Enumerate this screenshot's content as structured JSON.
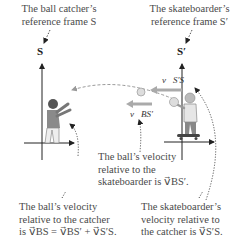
{
  "labels": {
    "catcher_frame": [
      "The ball catcher’s",
      "reference frame S"
    ],
    "skater_frame": [
      "The skateboarder’s",
      "reference frame S′"
    ],
    "axis_s": "S",
    "axis_s_prime": "S′",
    "v_ss": "v⃗S′S",
    "v_bs_prime": "v⃗BS′",
    "ball_rel_skater": [
      "The ball’s velocity",
      "relative to the",
      "skateboarder is v⃗BS′."
    ],
    "ball_rel_catcher": [
      "The ball’s velocity",
      "relative to the catcher",
      "is v⃗BS = v⃗BS′ + v⃗S′S."
    ],
    "skater_rel_catcher": [
      "The skateboarder’s",
      "velocity relative to",
      "the catcher is v⃗S′S."
    ]
  },
  "colors": {
    "text": "#4a4a4a",
    "axis": "#222222",
    "arrow": "#9a9a9a",
    "figure_shirt": "#8a8a8a",
    "figure_skin": "#7a7a7a"
  }
}
